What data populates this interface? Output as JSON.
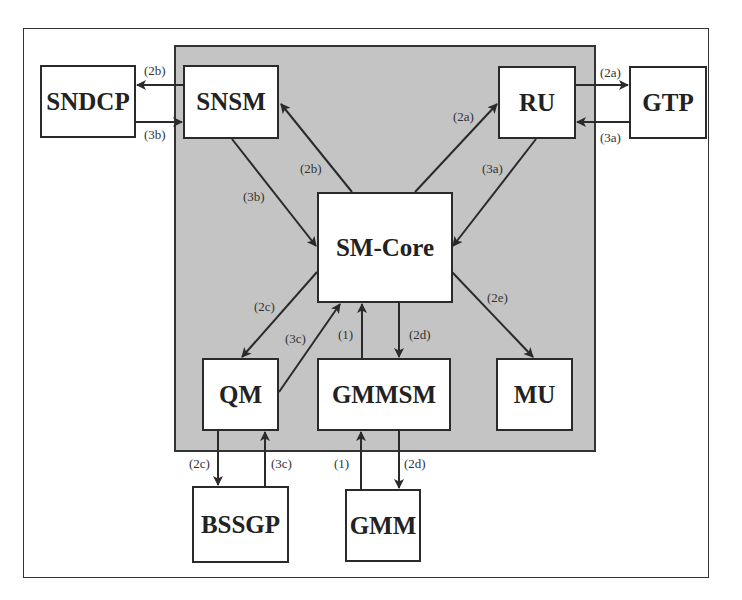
{
  "diagram": {
    "type": "block-diagram",
    "container_label": "",
    "colors": {
      "panel": "#c4c4c4",
      "box": "#ffffff",
      "line": "#2a2a2a"
    },
    "nodes": {
      "sndcp": "SNDCP",
      "snsm": "SNSM",
      "ru": "RU",
      "gtp": "GTP",
      "smcore": "SM-Core",
      "qm": "QM",
      "gmmsm": "GMMSM",
      "mu": "MU",
      "bssgp": "BSSGP",
      "gmm": "GMM"
    },
    "edges": [
      {
        "from": "SNSM",
        "to": "SNDCP",
        "label": "(2b)"
      },
      {
        "from": "SNDCP",
        "to": "SNSM",
        "label": "(3b)"
      },
      {
        "from": "SM-Core",
        "to": "SNSM",
        "label": "(2b)"
      },
      {
        "from": "SNSM",
        "to": "SM-Core",
        "label": "(3b)"
      },
      {
        "from": "SM-Core",
        "to": "RU",
        "label": "(2a)"
      },
      {
        "from": "RU",
        "to": "SM-Core",
        "label": "(3a)"
      },
      {
        "from": "RU",
        "to": "GTP",
        "label": "(2a)"
      },
      {
        "from": "GTP",
        "to": "RU",
        "label": "(3a)"
      },
      {
        "from": "SM-Core",
        "to": "QM",
        "label": "(2c)"
      },
      {
        "from": "QM",
        "to": "SM-Core",
        "label": "(3c)"
      },
      {
        "from": "GMMSM",
        "to": "SM-Core",
        "label": "(1)"
      },
      {
        "from": "SM-Core",
        "to": "GMMSM",
        "label": "(2d)"
      },
      {
        "from": "SM-Core",
        "to": "MU",
        "label": "(2e)"
      },
      {
        "from": "QM",
        "to": "BSSGP",
        "label": "(2c)"
      },
      {
        "from": "BSSGP",
        "to": "QM",
        "label": "(3c)"
      },
      {
        "from": "GMM",
        "to": "GMMSM",
        "label": "(1)"
      },
      {
        "from": "GMMSM",
        "to": "GMM",
        "label": "(2d)"
      }
    ],
    "labels": {
      "l_2b_top": "(2b)",
      "l_3b_left": "(3b)",
      "l_2b_diag": "(2b)",
      "l_3b_diag": "(3b)",
      "l_2a_diag": "(2a)",
      "l_3a_diag": "(3a)",
      "l_2a_right": "(2a)",
      "l_3a_right": "(3a)",
      "l_2c_diag": "(2c)",
      "l_3c_diag": "(3c)",
      "l_1_in": "(1)",
      "l_2d_in": "(2d)",
      "l_2e": "(2e)",
      "l_2c_out": "(2c)",
      "l_3c_out": "(3c)",
      "l_1_out": "(1)",
      "l_2d_out": "(2d)"
    }
  }
}
